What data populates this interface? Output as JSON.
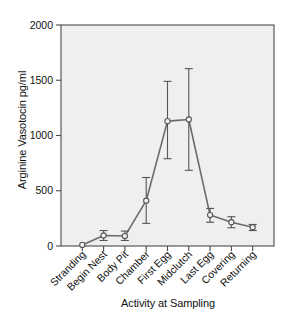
{
  "chart_data": {
    "type": "line",
    "title": "",
    "xlabel": "Activity at Sampling",
    "ylabel": "Arginine Vasotocin pg/ml",
    "categories": [
      "Stranding",
      "Begin Nest",
      "Body Pit",
      "Chamber",
      "First Egg",
      "Midclutch",
      "Last Egg",
      "Covering",
      "Returning"
    ],
    "values": [
      10,
      95,
      90,
      410,
      1130,
      1145,
      280,
      215,
      170
    ],
    "error_low": [
      10,
      50,
      50,
      205,
      790,
      685,
      215,
      165,
      140
    ],
    "error_high": [
      10,
      140,
      135,
      620,
      1490,
      1605,
      340,
      265,
      195
    ],
    "ylim": [
      0,
      2000
    ],
    "yticks": [
      0,
      500,
      1000,
      1500,
      2000
    ],
    "ytick_labels": [
      "0",
      "500",
      "1000",
      "1500",
      "2000"
    ],
    "grid": false,
    "legend": "none",
    "marker": "open-circle",
    "line_color": "#6b6b6b",
    "marker_face_color": "#f2f2f2",
    "plot_background": "#efefef",
    "frame_color": "#4a4a4a"
  },
  "axes": {
    "ylabel": "Arginine Vasotocin pg/ml",
    "xlabel": "Activity at Sampling"
  }
}
